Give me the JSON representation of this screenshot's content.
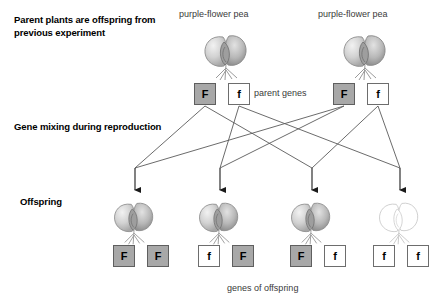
{
  "diagram": {
    "stage_labels": {
      "parents": "Parent plants are offspring from previous experiment",
      "mixing": "Gene mixing during reproduction",
      "offspring": "Offspring"
    },
    "captions": {
      "parent_left": "purple-flower pea",
      "parent_right": "purple-flower pea",
      "parent_genes": "parent genes",
      "offspring_genes": "genes of offspring"
    },
    "colors": {
      "dominant_box_fill": "#a8a8a8",
      "recessive_box_fill": "#ffffff",
      "box_border": "#6d6d6d",
      "line": "#5a5a5a",
      "text": "#000000",
      "caption_text": "#3a3a3a",
      "purple_flower": "#b9b9b9",
      "white_flower": "#ffffff"
    },
    "parents": [
      {
        "name": "parent-left",
        "caption": "purple-flower pea",
        "phenotype": "purple",
        "alleles": [
          {
            "symbol": "F",
            "type": "dominant"
          },
          {
            "symbol": "f",
            "type": "recessive"
          }
        ]
      },
      {
        "name": "parent-right",
        "caption": "purple-flower pea",
        "phenotype": "purple",
        "alleles": [
          {
            "symbol": "F",
            "type": "dominant"
          },
          {
            "symbol": "f",
            "type": "recessive"
          }
        ]
      }
    ],
    "offspring": [
      {
        "name": "offspring-1",
        "phenotype": "purple",
        "genotype": "FF",
        "alleles": [
          {
            "symbol": "F",
            "type": "dominant"
          },
          {
            "symbol": "F",
            "type": "dominant"
          }
        ]
      },
      {
        "name": "offspring-2",
        "phenotype": "purple",
        "genotype": "fF",
        "alleles": [
          {
            "symbol": "f",
            "type": "recessive"
          },
          {
            "symbol": "F",
            "type": "dominant"
          }
        ]
      },
      {
        "name": "offspring-3",
        "phenotype": "purple",
        "genotype": "Ff",
        "alleles": [
          {
            "symbol": "F",
            "type": "dominant"
          },
          {
            "symbol": "f",
            "type": "recessive"
          }
        ]
      },
      {
        "name": "offspring-4",
        "phenotype": "white",
        "genotype": "ff",
        "alleles": [
          {
            "symbol": "f",
            "type": "recessive"
          },
          {
            "symbol": "f",
            "type": "recessive"
          }
        ]
      }
    ]
  }
}
